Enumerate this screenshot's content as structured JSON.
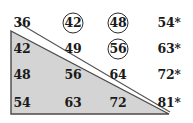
{
  "figure": {
    "type": "multiplication-grid-with-shaded-triangle",
    "shape": {
      "name": "shaded-triangle",
      "fill_color": "#d4d4d4",
      "stroke_color": "#4a4a4a"
    },
    "line_color": "#555555",
    "text_color": "#1a1a1a"
  },
  "grid": {
    "rows": [
      {
        "cells": [
          {
            "value": "36",
            "circled": false,
            "starred": false
          },
          {
            "value": "42",
            "circled": true,
            "starred": false
          },
          {
            "value": "48",
            "circled": true,
            "starred": false
          },
          {
            "value": "54",
            "circled": false,
            "starred": true
          }
        ]
      },
      {
        "cells": [
          {
            "value": "42",
            "circled": false,
            "starred": false
          },
          {
            "value": "49",
            "circled": false,
            "starred": false
          },
          {
            "value": "56",
            "circled": true,
            "starred": false
          },
          {
            "value": "63",
            "circled": false,
            "starred": true
          }
        ]
      },
      {
        "cells": [
          {
            "value": "48",
            "circled": false,
            "starred": false
          },
          {
            "value": "56",
            "circled": false,
            "starred": false
          },
          {
            "value": "64",
            "circled": false,
            "starred": false
          },
          {
            "value": "72",
            "circled": false,
            "starred": true
          }
        ]
      },
      {
        "cells": [
          {
            "value": "54",
            "circled": false,
            "starred": false
          },
          {
            "value": "63",
            "circled": false,
            "starred": false
          },
          {
            "value": "72",
            "circled": false,
            "starred": false
          },
          {
            "value": "81",
            "circled": false,
            "starred": true
          }
        ]
      }
    ],
    "column_x": [
      22,
      73,
      118,
      169
    ],
    "row_y": [
      23,
      49,
      75,
      103
    ],
    "star_symbol": "*"
  }
}
